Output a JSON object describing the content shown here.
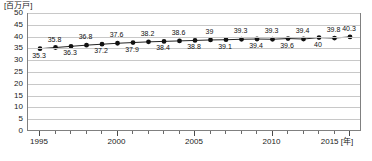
{
  "unit_label": "[百万戸]",
  "x_axis_unit": "[年]",
  "chart_data": {
    "type": "line",
    "title": "",
    "subtitle": "",
    "xlabel": "[年]",
    "ylabel": "[百万戸]",
    "xlim": [
      1995,
      2015
    ],
    "ylim": [
      0,
      50
    ],
    "grid": true,
    "legend": "none",
    "y_ticks": [
      "0",
      "5",
      "10",
      "15",
      "20",
      "25",
      "30",
      "35",
      "40",
      "45",
      "50"
    ],
    "y_tick_values": [
      0,
      5,
      10,
      15,
      20,
      25,
      30,
      35,
      40,
      45,
      50
    ],
    "x_tick_labels": [
      "1995",
      "2000",
      "2005",
      "2010",
      "2015"
    ],
    "x_tick_values": [
      1995,
      2000,
      2005,
      2010,
      2015
    ],
    "x": [
      1995,
      1996,
      1997,
      1998,
      1999,
      2000,
      2001,
      2002,
      2003,
      2004,
      2005,
      2006,
      2007,
      2008,
      2009,
      2010,
      2011,
      2012,
      2013,
      2014,
      2015
    ],
    "values": [
      35.3,
      35.8,
      36.3,
      36.8,
      37.2,
      37.6,
      37.9,
      38.2,
      38.4,
      38.6,
      38.8,
      39,
      39.1,
      39.3,
      39.4,
      39.3,
      39.6,
      39.4,
      40,
      39.8,
      40.3
    ],
    "point_labels": [
      "35.3",
      "35.8",
      "36.3",
      "36.8",
      "37.2",
      "37.6",
      "37.9",
      "38.2",
      "38.4",
      "38.6",
      "38.8",
      "39",
      "39.1",
      "39.3",
      "39.4",
      "39.3",
      "39.6",
      "39.4",
      "40",
      "39.8",
      "40.3"
    ],
    "label_positions": [
      "below",
      "above",
      "below",
      "above",
      "below",
      "above",
      "below",
      "above",
      "below",
      "above",
      "below",
      "above",
      "below",
      "above",
      "below",
      "above",
      "below",
      "above",
      "below",
      "above",
      "above"
    ],
    "series_color": "#222222",
    "marker_color": "#111111",
    "grid_color": "#c8c8c8",
    "frame_color": "#808080"
  }
}
